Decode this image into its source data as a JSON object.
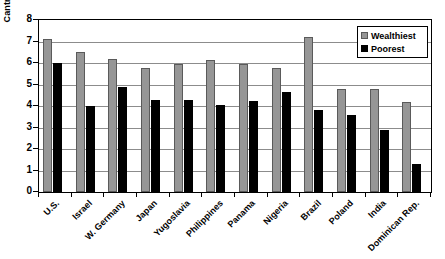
{
  "chart_data": {
    "type": "bar",
    "title": "",
    "xlabel": "",
    "ylabel": "Cantril Personal Happiness Rating",
    "ylim": [
      0,
      8
    ],
    "ytick_step": 1,
    "yticks": [
      "0",
      "1",
      "2",
      "3",
      "4",
      "5",
      "6",
      "7",
      "8"
    ],
    "grid": true,
    "grid_axis": "y",
    "legend_position": "top-right",
    "categories": [
      "U.S.",
      "Israel",
      "W. Germany",
      "Japan",
      "Yugoslavia",
      "Philippines",
      "Panama",
      "Nigeria",
      "Brazil",
      "Poland",
      "India",
      "Dominican Rep."
    ],
    "series": [
      {
        "name": "Wealthiest",
        "color": "#969696",
        "values": [
          7.1,
          6.5,
          6.2,
          5.75,
          5.95,
          6.15,
          5.95,
          5.75,
          7.2,
          4.8,
          4.8,
          4.2
        ]
      },
      {
        "name": "Poorest",
        "color": "#000000",
        "values": [
          6.0,
          4.0,
          4.9,
          4.3,
          4.3,
          4.05,
          4.25,
          4.65,
          3.8,
          3.6,
          2.9,
          1.3
        ]
      }
    ]
  },
  "legend": {
    "items": [
      {
        "label": "Wealthiest",
        "swatch": "wealthiest-swatch"
      },
      {
        "label": "Poorest",
        "swatch": "poorest-swatch"
      }
    ]
  }
}
